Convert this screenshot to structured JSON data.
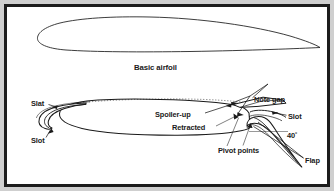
{
  "figure": {
    "type": "technical-diagram",
    "background_color": "#ffffff",
    "border_color": "#1c1c1c",
    "line_color": "#1a1a1a",
    "outer_margin_color": "#cfcfcf"
  },
  "labels": {
    "basic_airfoil": "Basic airfoil",
    "slat": "Slat",
    "slot_left": "Slot",
    "spoiler_up": "Spoiler-up",
    "retracted": "Retracted",
    "note_gap": "Note gap",
    "slot_right": "Slot",
    "pivot_points": "Pivot points",
    "flap_angle": "40˚",
    "flap": "Flap"
  },
  "annotations": [
    {
      "name": "basic-airfoil-caption",
      "text": "Basic airfoil",
      "x": 134,
      "y": 69
    },
    {
      "name": "slat-label",
      "text": "Slat",
      "x": 31,
      "y": 105
    },
    {
      "name": "slot-left-label",
      "text": "Slot",
      "x": 31,
      "y": 141
    },
    {
      "name": "spoiler-up-label",
      "text": "Spoiler-up",
      "x": 155,
      "y": 116
    },
    {
      "name": "retracted-label",
      "text": "Retracted",
      "x": 172,
      "y": 129
    },
    {
      "name": "note-gap-label",
      "text": "Note gap",
      "x": 254,
      "y": 100
    },
    {
      "name": "slot-right-label",
      "text": "Slot",
      "x": 288,
      "y": 118
    },
    {
      "name": "pivot-points-label",
      "text": "Pivot points",
      "x": 218,
      "y": 151
    },
    {
      "name": "flap-angle-label",
      "text": "40˚",
      "x": 287,
      "y": 136
    },
    {
      "name": "flap-label",
      "text": "Flap",
      "x": 305,
      "y": 161
    }
  ]
}
